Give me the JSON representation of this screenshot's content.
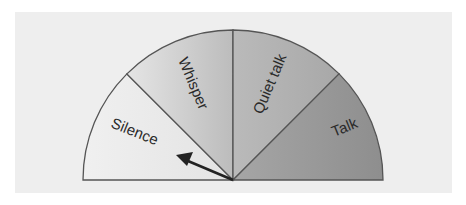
{
  "diagram": {
    "type": "semicircle-gauge",
    "background_color": "#eeeeee",
    "center": [
      233,
      180
    ],
    "radius": 150,
    "sectors": [
      {
        "label": "Silence",
        "start_deg": 180,
        "end_deg": 135,
        "color_from": "#f0f0f0",
        "color_to": "#e3e3e3"
      },
      {
        "label": "Whisper",
        "start_deg": 135,
        "end_deg": 90,
        "color_from": "#e5e5e5",
        "color_to": "#bcbcbc"
      },
      {
        "label": "Quiet talk",
        "start_deg": 90,
        "end_deg": 45,
        "color_from": "#bababa",
        "color_to": "#a8a8a8"
      },
      {
        "label": "Talk",
        "start_deg": 45,
        "end_deg": 0,
        "color_from": "#a6a6a6",
        "color_to": "#8e8e8e"
      }
    ],
    "needle": {
      "points_to": "Silence",
      "angle_deg": 157
    }
  }
}
